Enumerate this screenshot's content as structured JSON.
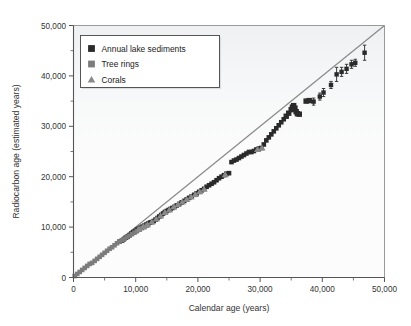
{
  "chart_data": {
    "type": "scatter",
    "title": "",
    "xlabel": "Calendar age (years)",
    "ylabel": "Radiocarbon age (estimated years)",
    "xlim": [
      0,
      50000
    ],
    "ylim": [
      0,
      50000
    ],
    "xticks": [
      0,
      10000,
      20000,
      30000,
      40000,
      50000
    ],
    "yticks": [
      0,
      10000,
      20000,
      30000,
      40000,
      50000
    ],
    "xtick_labels": [
      "0",
      "10,000",
      "20,000",
      "30,000",
      "40,000",
      "50,000"
    ],
    "ytick_labels": [
      "0",
      "10,000",
      "20,000",
      "30,000",
      "40,000",
      "50,000"
    ],
    "xminor_ticks": [
      5000,
      15000,
      25000,
      35000,
      45000
    ],
    "yminor_ticks": [
      5000,
      15000,
      25000,
      35000,
      45000
    ],
    "grid": false,
    "legend_position": "upper left",
    "reference_line": {
      "name": "one-to-one line",
      "from": [
        0,
        0
      ],
      "to": [
        50000,
        50000
      ],
      "color": "#8c8c8c"
    },
    "series": [
      {
        "name": "Annual lake sediments",
        "marker": "square",
        "color": "#2a2a2a",
        "points": [
          [
            7400,
            7100
          ],
          [
            7800,
            7300
          ],
          [
            8100,
            7600
          ],
          [
            8400,
            7900
          ],
          [
            8700,
            8100
          ],
          [
            9000,
            8400
          ],
          [
            9300,
            8700
          ],
          [
            9600,
            9000
          ],
          [
            9900,
            9200
          ],
          [
            10200,
            9500
          ],
          [
            10500,
            9700
          ],
          [
            10800,
            9900
          ],
          [
            11100,
            10100
          ],
          [
            11400,
            10300
          ],
          [
            11700,
            10500
          ],
          [
            12000,
            10700
          ],
          [
            12300,
            10900
          ],
          [
            12600,
            11000
          ],
          [
            12900,
            11200
          ],
          [
            13200,
            11500
          ],
          [
            13500,
            11800
          ],
          [
            13800,
            12100
          ],
          [
            14100,
            12400
          ],
          [
            14400,
            12700
          ],
          [
            14700,
            13000
          ],
          [
            15000,
            13200
          ],
          [
            15300,
            13400
          ],
          [
            15600,
            13600
          ],
          [
            15900,
            13800
          ],
          [
            16200,
            14000
          ],
          [
            16600,
            14300
          ],
          [
            17000,
            14600
          ],
          [
            17400,
            14900
          ],
          [
            17800,
            15200
          ],
          [
            18200,
            15500
          ],
          [
            18600,
            15800
          ],
          [
            19000,
            16100
          ],
          [
            19400,
            16400
          ],
          [
            19800,
            16700
          ],
          [
            20200,
            17000
          ],
          [
            20600,
            17300
          ],
          [
            21000,
            17600
          ],
          [
            21400,
            18000
          ],
          [
            21800,
            18300
          ],
          [
            22200,
            18600
          ],
          [
            22600,
            18900
          ],
          [
            23000,
            19300
          ],
          [
            23400,
            19700
          ],
          [
            23800,
            20000
          ],
          [
            24200,
            20300
          ],
          [
            24600,
            20600
          ],
          [
            25000,
            20700
          ],
          [
            25400,
            22900
          ],
          [
            25800,
            23200
          ],
          [
            26200,
            23400
          ],
          [
            26600,
            23700
          ],
          [
            27000,
            24000
          ],
          [
            27400,
            24300
          ],
          [
            27800,
            24600
          ],
          [
            28200,
            24900
          ],
          [
            28600,
            24900
          ],
          [
            29000,
            25100
          ],
          [
            29400,
            25400
          ],
          [
            29800,
            25600
          ],
          [
            30200,
            25700
          ],
          [
            30600,
            26400
          ],
          [
            31000,
            27200
          ],
          [
            31400,
            27800
          ],
          [
            31800,
            28400
          ],
          [
            32200,
            29000
          ],
          [
            32600,
            29600
          ],
          [
            33000,
            30200
          ],
          [
            33400,
            30800
          ],
          [
            33800,
            31400
          ],
          [
            34200,
            32000
          ],
          [
            34600,
            32600
          ],
          [
            35000,
            33300
          ],
          [
            35200,
            33800
          ],
          [
            35400,
            34100
          ],
          [
            35600,
            33600
          ],
          [
            35800,
            32900
          ],
          [
            36000,
            32500
          ],
          [
            36300,
            32400
          ],
          [
            37400,
            35000
          ],
          [
            37900,
            35100
          ]
        ]
      },
      {
        "name": "Tree rings",
        "marker": "square",
        "color": "#7c7c7c",
        "points": [
          [
            200,
            300
          ],
          [
            600,
            700
          ],
          [
            1000,
            1100
          ],
          [
            1400,
            1500
          ],
          [
            1800,
            1900
          ],
          [
            2200,
            2300
          ],
          [
            2600,
            2700
          ],
          [
            3000,
            2900
          ],
          [
            3400,
            3300
          ],
          [
            3800,
            3700
          ],
          [
            4200,
            4100
          ],
          [
            4600,
            4500
          ],
          [
            5000,
            4900
          ],
          [
            5400,
            5300
          ],
          [
            5800,
            5700
          ],
          [
            6200,
            6000
          ],
          [
            6600,
            6400
          ],
          [
            7000,
            6800
          ],
          [
            7400,
            7100
          ],
          [
            7800,
            7400
          ],
          [
            8200,
            7700
          ],
          [
            8600,
            8000
          ],
          [
            9000,
            8300
          ],
          [
            9400,
            8600
          ],
          [
            9800,
            8900
          ],
          [
            10200,
            9200
          ],
          [
            10600,
            9500
          ],
          [
            11000,
            9800
          ],
          [
            11400,
            10000
          ],
          [
            11800,
            10300
          ]
        ]
      },
      {
        "name": "Corals",
        "marker": "triangle",
        "color": "#8a8a8a",
        "points": [
          [
            10500,
            9600
          ],
          [
            11200,
            10100
          ],
          [
            11900,
            10500
          ],
          [
            12600,
            11000
          ],
          [
            13300,
            11600
          ],
          [
            14000,
            12200
          ],
          [
            14700,
            12900
          ],
          [
            15400,
            13400
          ],
          [
            16100,
            14000
          ],
          [
            16800,
            14500
          ],
          [
            17500,
            15000
          ],
          [
            18200,
            15500
          ],
          [
            18900,
            16000
          ],
          [
            19600,
            16500
          ],
          [
            20300,
            17000
          ],
          [
            21000,
            17500
          ],
          [
            24400,
            20400
          ],
          [
            29600,
            25400
          ],
          [
            30300,
            25700
          ]
        ]
      },
      {
        "name": "Corals with error bars",
        "marker": "square-error",
        "color": "#2a2a2a",
        "points": [
          [
            38600,
            34900
          ],
          [
            39600,
            35900
          ],
          [
            40200,
            36700
          ],
          [
            41400,
            38200
          ],
          [
            42300,
            40300
          ],
          [
            43100,
            40800
          ],
          [
            43900,
            41400
          ],
          [
            44700,
            42300
          ],
          [
            45300,
            42600
          ],
          [
            46800,
            44600
          ]
        ],
        "errors": [
          700,
          700,
          800,
          700,
          1400,
          900,
          900,
          800,
          700,
          1500
        ]
      }
    ]
  },
  "legend": {
    "entries": [
      {
        "label": "Annual lake sediments",
        "marker": "dark-square"
      },
      {
        "label": "Tree rings",
        "marker": "gray-square"
      },
      {
        "label": "Corals",
        "marker": "gray-triangle"
      }
    ]
  },
  "colors": {
    "plot_background": "#fcfcfc",
    "axis": "#555555",
    "reference_line": "#8c8c8c",
    "sediments": "#2a2a2a",
    "tree_rings": "#7c7c7c",
    "corals": "#8a8a8a",
    "legend_border": "#444444",
    "legend_background": "#ffffff"
  }
}
